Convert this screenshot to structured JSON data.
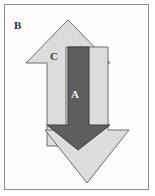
{
  "figure": {
    "type": "overlapping-arrows-diagram",
    "background_color": "#ffffff",
    "frame": {
      "border_color": "#8d8d8d",
      "fill_color": "#fdfdfd",
      "x": 4,
      "y": 4,
      "width": 145,
      "height": 186
    },
    "labels": [
      {
        "id": "B",
        "text": "B",
        "x": 14,
        "y": 20,
        "color": "#2b2b2b",
        "description": "outer-region-label"
      },
      {
        "id": "C",
        "text": "C",
        "x": 50,
        "y": 51,
        "color": "#3a3a3a",
        "description": "light-arrow-region-label"
      },
      {
        "id": "A",
        "text": "A",
        "x": 71,
        "y": 89,
        "color": "#f2f2f2",
        "description": "dark-arrow-region-label"
      }
    ],
    "shapes": [
      {
        "id": "up-arrow-light",
        "name": "light-gray-up-arrow",
        "direction": "up",
        "fill": "#dcdcdc",
        "stroke": "#6e6e6e",
        "stroke_width": 1,
        "points": "68,20 110,63 89,63 89,146 47,146 47,63 26,63"
      },
      {
        "id": "down-arrow-light",
        "name": "light-gray-down-arrow",
        "direction": "down",
        "fill": "#dcdcdc",
        "stroke": "#6e6e6e",
        "stroke_width": 1,
        "points": "66,47 108,47 108,130 129,130 87,183 45,130 66,130"
      },
      {
        "id": "down-arrow-dark",
        "name": "dark-gray-down-arrow",
        "direction": "down",
        "fill": "#5e5e5e",
        "stroke": "#3c3c3c",
        "stroke_width": 1,
        "points": "68,47 89,47 89,125 110,125 78,150 47,125 68,125"
      }
    ],
    "colors": {
      "light_arrow_fill": "#dcdcdc",
      "light_arrow_stroke": "#6e6e6e",
      "dark_arrow_fill": "#5e5e5e",
      "dark_arrow_stroke": "#3c3c3c",
      "frame_stroke": "#8d8d8d",
      "label_dark": "#2b2b2b",
      "label_light": "#f2f2f2"
    }
  }
}
